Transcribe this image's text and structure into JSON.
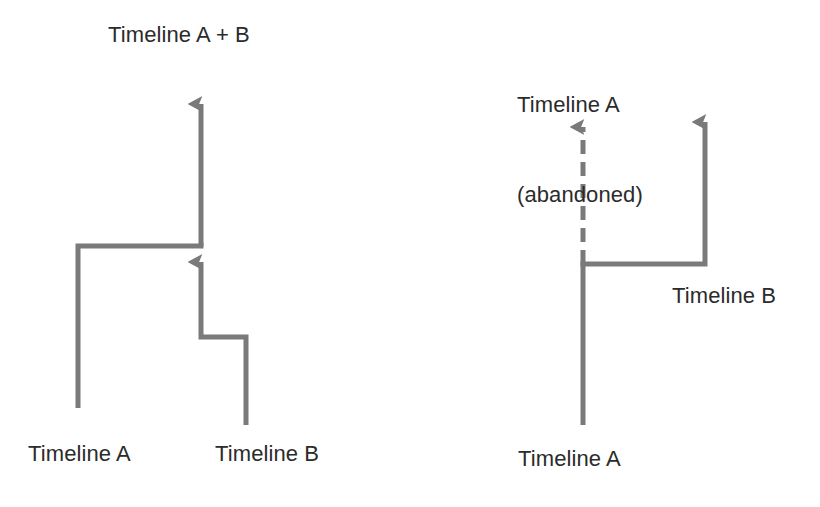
{
  "figure": {
    "type": "diagram",
    "subtype": "timeline-branch-merge",
    "background_color": "#ffffff",
    "stroke_color": "#7a7a7a",
    "text_color": "#2b2b2b",
    "stroke_width": 5
  },
  "left_panel": {
    "title": "Timeline A + B",
    "caption_a": "Timeline A",
    "caption_b": "Timeline B",
    "description": "Two timelines merge into one combined timeline"
  },
  "right_panel": {
    "title_line1": "Timeline A",
    "title_line2": "(abandoned)",
    "caption_b": "Timeline B",
    "caption_a": "Timeline A",
    "description": "One timeline branches; original is abandoned (dashed) while branch continues"
  },
  "geometry": {
    "left": {
      "merged_trunk": {
        "x": 201,
        "y_top": 95,
        "y_bottom": 246
      },
      "merged_arrow_tip_y": 95,
      "timeline_a_vertical": {
        "x": 78,
        "y_top": 246,
        "y_bottom": 408
      },
      "timeline_a_horizontal": {
        "y": 246,
        "x_start": 78,
        "x_end": 201
      },
      "timeline_b_vertical_lower": {
        "x": 246,
        "y_top": 337,
        "y_bottom": 425
      },
      "timeline_b_horizontal": {
        "y": 337,
        "x_start": 201,
        "x_end": 246
      },
      "timeline_b_vertical_upper": {
        "x": 201,
        "y_top": 252,
        "y_bottom": 337
      },
      "merge_arrow_tip_y": 252
    },
    "right": {
      "timeline_a_vertical": {
        "x": 583,
        "y_top": 264,
        "y_bottom": 425
      },
      "abandoned_dashed": {
        "x": 583,
        "y_top": 118,
        "y_bottom": 264
      },
      "abandoned_arrow_tip_y": 118,
      "branch_horizontal": {
        "y": 264,
        "x_start": 583,
        "x_end": 705
      },
      "timeline_b_vertical": {
        "x": 705,
        "y_top": 113,
        "y_bottom": 264
      },
      "timeline_b_arrow_tip_y": 113,
      "dash_pattern": "14 8"
    }
  },
  "labels": {
    "left_title": {
      "text": "Timeline A + B",
      "x": 108,
      "y": 22
    },
    "left_a": {
      "text": "Timeline A",
      "x": 28,
      "y": 441
    },
    "left_b": {
      "text": "Timeline B",
      "x": 215,
      "y": 441
    },
    "right_title_1": {
      "text": "Timeline A",
      "x": 517,
      "y": 32
    },
    "right_title_2": {
      "text": "(abandoned)",
      "x": 517,
      "y": 62
    },
    "right_b": {
      "text": "Timeline B",
      "x": 672,
      "y": 283
    },
    "right_a": {
      "text": "Timeline A",
      "x": 518,
      "y": 446
    }
  }
}
